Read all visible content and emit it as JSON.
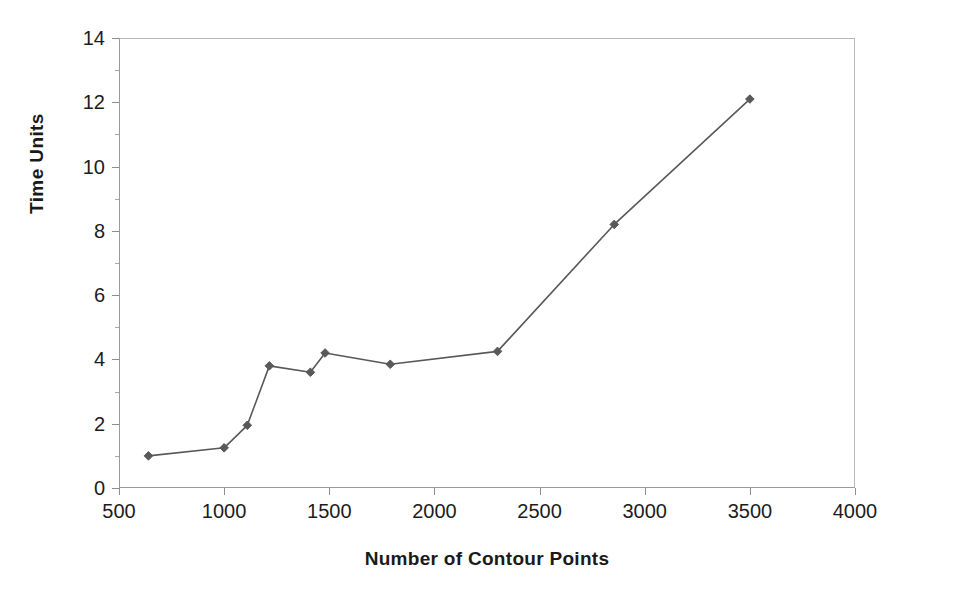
{
  "chart_data": {
    "type": "line",
    "title": "",
    "xlabel": "Number of Contour Points",
    "ylabel": "Time Units",
    "xlim": [
      500,
      4000
    ],
    "ylim": [
      0,
      14
    ],
    "xticks": [
      500,
      1000,
      1500,
      2000,
      2500,
      3000,
      3500,
      4000
    ],
    "yticks": [
      0,
      2,
      4,
      6,
      8,
      10,
      12,
      14
    ],
    "yticks_minor": [
      1,
      3,
      5,
      7,
      9,
      11,
      13
    ],
    "grid": false,
    "legend": "none",
    "marker": "diamond",
    "series": [
      {
        "name": "Time Units",
        "color": "#595959",
        "x": [
          640,
          1000,
          1110,
          1215,
          1410,
          1480,
          1790,
          2300,
          2855,
          3500
        ],
        "y": [
          1.0,
          1.25,
          1.95,
          3.8,
          3.6,
          4.2,
          3.85,
          4.25,
          8.2,
          12.1
        ]
      }
    ]
  },
  "axes": {
    "y_tick_labels": [
      "14",
      "12",
      "10",
      "8",
      "6",
      "4",
      "2",
      "0"
    ],
    "x_tick_labels": [
      "500",
      "1000",
      "1500",
      "2000",
      "2500",
      "3000",
      "3500",
      "4000"
    ],
    "y_title": "Time Units",
    "x_title": "Number of Contour Points"
  },
  "style": {
    "series_color": "#595959",
    "axis_color": "#9a9a9a",
    "frame_color": "#b8b8b8",
    "text_color": "#1c1c1c",
    "background": "#ffffff"
  }
}
